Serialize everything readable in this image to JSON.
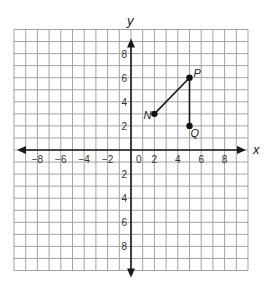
{
  "diagram": {
    "type": "coordinate-plane",
    "grid": {
      "x_min": -10,
      "x_max": 10,
      "y_min": -10,
      "y_max": 10,
      "step": 1,
      "origin_px": [
        131,
        150
      ],
      "unit_px_x": 11.7,
      "unit_px_y": 12.05
    },
    "axes": {
      "x_label": "x",
      "y_label": "y",
      "origin_label": "0",
      "x_ticks": [
        {
          "value": -8,
          "label": "−8"
        },
        {
          "value": -6,
          "label": "−6"
        },
        {
          "value": -4,
          "label": "−4"
        },
        {
          "value": -2,
          "label": "−2"
        },
        {
          "value": 2,
          "label": "2"
        },
        {
          "value": 4,
          "label": "4"
        },
        {
          "value": 6,
          "label": "6"
        },
        {
          "value": 8,
          "label": "8"
        }
      ],
      "y_ticks": [
        {
          "value": 8,
          "label": "8"
        },
        {
          "value": 6,
          "label": "6"
        },
        {
          "value": 4,
          "label": "4"
        },
        {
          "value": 2,
          "label": "2"
        },
        {
          "value": -2,
          "label": "2"
        },
        {
          "value": -4,
          "label": "4"
        },
        {
          "value": -6,
          "label": "6"
        },
        {
          "value": -8,
          "label": "8"
        }
      ]
    },
    "points": [
      {
        "name": "N",
        "x": 2,
        "y": 3,
        "label_dx": -11,
        "label_dy": 5
      },
      {
        "name": "P",
        "x": 5,
        "y": 6,
        "label_dx": 4,
        "label_dy": -1
      },
      {
        "name": "Q",
        "x": 5,
        "y": 2,
        "label_dx": 1,
        "label_dy": 11
      }
    ],
    "segments": [
      {
        "from": "N",
        "to": "P"
      },
      {
        "from": "P",
        "to": "Q"
      }
    ]
  }
}
